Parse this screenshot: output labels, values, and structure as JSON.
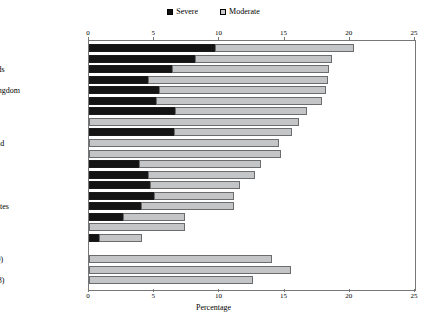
{
  "legend": {
    "items": [
      {
        "label": "Severe",
        "color": "#141414",
        "icon": "filled-square-icon"
      },
      {
        "label": "Moderate",
        "color": "#c3c5c7",
        "icon": "hatched-square-icon"
      }
    ]
  },
  "axis": {
    "title": "Percentage",
    "ticks": [
      "0",
      "5",
      "10",
      "15",
      "20",
      "25"
    ],
    "min": 0,
    "max": 25
  },
  "chart_data": {
    "type": "bar",
    "orientation": "horizontal",
    "stacked": true,
    "title": "",
    "xlabel": "Percentage",
    "ylabel": "",
    "xlim": [
      0,
      25
    ],
    "grid": false,
    "legend_position": "top-center",
    "categories": [
      "Sweden",
      "Portugal",
      "Netherlands",
      "Denmark",
      "United Kingdom",
      "Germany",
      "Norway",
      "Canada",
      "France",
      "Switzerland",
      "Poland",
      "Austria",
      "Australia",
      "Spain",
      "Belgium",
      "United States",
      "Italy",
      "Mexico",
      "Korea",
      "",
      "OECD (19)",
      "EU (11)",
      "Non-EU (8)"
    ],
    "series": [
      {
        "name": "Severe",
        "color": "#141414",
        "values": [
          9.7,
          8.1,
          6.4,
          4.5,
          5.4,
          5.1,
          6.6,
          0.0,
          6.5,
          0.0,
          0.0,
          3.8,
          4.5,
          4.7,
          5.0,
          4.0,
          2.6,
          0.0,
          0.8,
          null,
          0.0,
          0.0,
          0.0
        ]
      },
      {
        "name": "Moderate",
        "color": "#c3c5c7",
        "values": [
          10.6,
          10.5,
          12.0,
          13.8,
          12.8,
          12.8,
          10.1,
          16.1,
          9.1,
          14.6,
          14.7,
          9.4,
          8.2,
          6.9,
          6.1,
          7.1,
          4.8,
          7.4,
          3.3,
          null,
          14.0,
          15.5,
          12.6
        ]
      }
    ],
    "totals": [
      20.3,
      18.6,
      18.4,
      18.3,
      18.2,
      17.9,
      16.7,
      16.1,
      15.6,
      14.6,
      14.7,
      13.2,
      12.7,
      11.6,
      11.1,
      11.1,
      7.4,
      7.4,
      4.1,
      null,
      14.0,
      15.5,
      12.6
    ]
  }
}
